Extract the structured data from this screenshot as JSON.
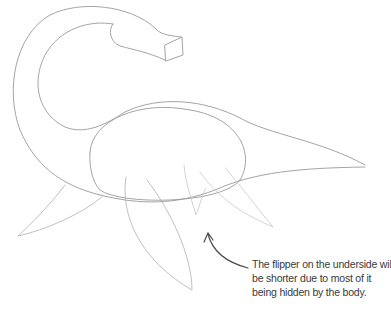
{
  "illustration": {
    "subject": "plesiosaur sketch",
    "stroke_color": "#9a9a9a",
    "light_stroke_color": "#c8c8c8",
    "arrow_color": "#4a4a4a"
  },
  "annotation": {
    "lines": [
      "The flipper on the underside will",
      "be shorter due to most of it",
      "being hidden by the body."
    ]
  }
}
